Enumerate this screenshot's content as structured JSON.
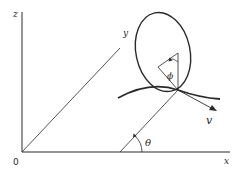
{
  "diagram": {
    "labels": {
      "z_axis": "z",
      "y_axis": "y",
      "x_axis": "x",
      "origin": "0",
      "theta": "θ",
      "phi": "ϕ",
      "velocity": "v"
    },
    "colors": {
      "line": "#2a2a2a",
      "background": "#ffffff"
    }
  }
}
